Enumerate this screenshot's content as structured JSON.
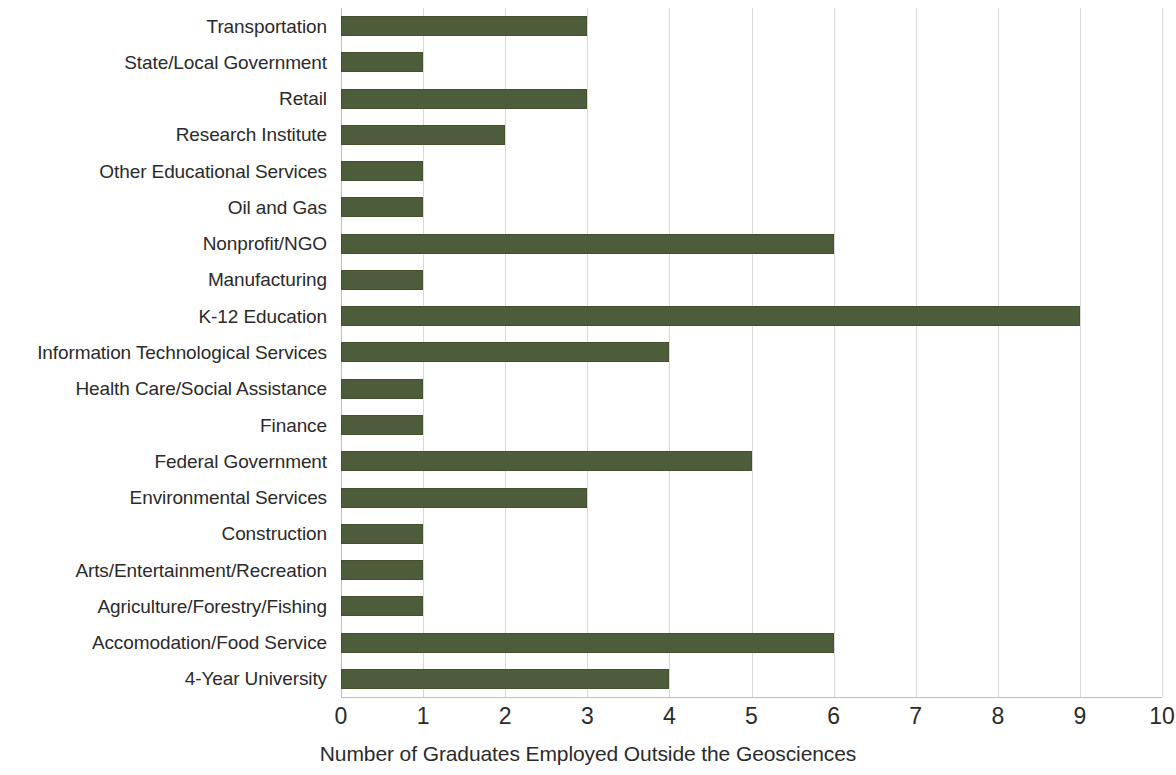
{
  "chart_data": {
    "type": "bar",
    "orientation": "horizontal",
    "title": "",
    "subtitle": "",
    "xlabel": "Number of Graduates Employed Outside the Geosciences",
    "ylabel": "",
    "xlim": [
      0,
      10
    ],
    "xticks": [
      "0",
      "1",
      "2",
      "3",
      "4",
      "5",
      "6",
      "7",
      "8",
      "9",
      "10"
    ],
    "grid": "vertical",
    "legend": "none",
    "bar_color": "#4d5c3b",
    "gridline_color": "#d9d9d9",
    "categories": [
      "Transportation",
      "State/Local Government",
      "Retail",
      "Research Institute",
      "Other Educational Services",
      "Oil and Gas",
      "Nonprofit/NGO",
      "Manufacturing",
      "K-12 Education",
      "Information Technological Services",
      "Health Care/Social Assistance",
      "Finance",
      "Federal Government",
      "Environmental Services",
      "Construction",
      "Arts/Entertainment/Recreation",
      "Agriculture/Forestry/Fishing",
      "Accomodation/Food Service",
      "4-Year University"
    ],
    "values": [
      3,
      1,
      3,
      2,
      1,
      1,
      6,
      1,
      9,
      4,
      1,
      1,
      5,
      3,
      1,
      1,
      1,
      6,
      4
    ]
  }
}
